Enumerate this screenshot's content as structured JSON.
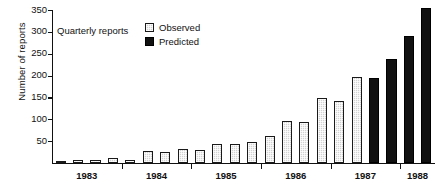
{
  "chart_data": {
    "type": "bar",
    "title": "",
    "xlabel": "",
    "ylabel": "Number of reports",
    "ylim": [
      0,
      350
    ],
    "yticks": [
      0,
      50,
      100,
      150,
      200,
      250,
      300,
      350
    ],
    "ytick_labels": [
      "",
      "50",
      "100",
      "150",
      "200",
      "250",
      "300",
      "350"
    ],
    "grid": false,
    "legend_position": "top-left",
    "legend_title": "Quarterly reports",
    "categories": [
      "1983 Q1",
      "1983 Q2",
      "1983 Q3",
      "1983 Q4",
      "1984 Q1",
      "1984 Q2",
      "1984 Q3",
      "1984 Q4",
      "1985 Q1",
      "1985 Q2",
      "1985 Q3",
      "1985 Q4",
      "1986 Q1",
      "1986 Q2",
      "1986 Q3",
      "1986 Q4",
      "1987 Q1",
      "1987 Q2",
      "1987 Q3",
      "1987 Q4",
      "1988 Q1",
      "1988 Q2"
    ],
    "xtick_labels": [
      "1983",
      "1984",
      "1985",
      "1986",
      "1987",
      "1988"
    ],
    "series": [
      {
        "name": "Observed",
        "color": "#d2d2d2",
        "values": [
          3,
          6,
          6,
          11,
          8,
          27,
          25,
          32,
          30,
          44,
          43,
          49,
          61,
          97,
          94,
          149,
          142,
          196,
          null,
          null,
          null,
          null
        ]
      },
      {
        "name": "Predicted",
        "color": "#111111",
        "values": [
          null,
          null,
          null,
          null,
          null,
          null,
          null,
          null,
          null,
          null,
          null,
          null,
          null,
          null,
          null,
          null,
          null,
          null,
          194,
          238,
          290,
          355
        ]
      }
    ]
  },
  "legend": {
    "title": "Quarterly reports",
    "entries": [
      {
        "label": "Observed",
        "swatch": "light-gray-swatch"
      },
      {
        "label": "Predicted",
        "swatch": "black-swatch"
      }
    ]
  }
}
